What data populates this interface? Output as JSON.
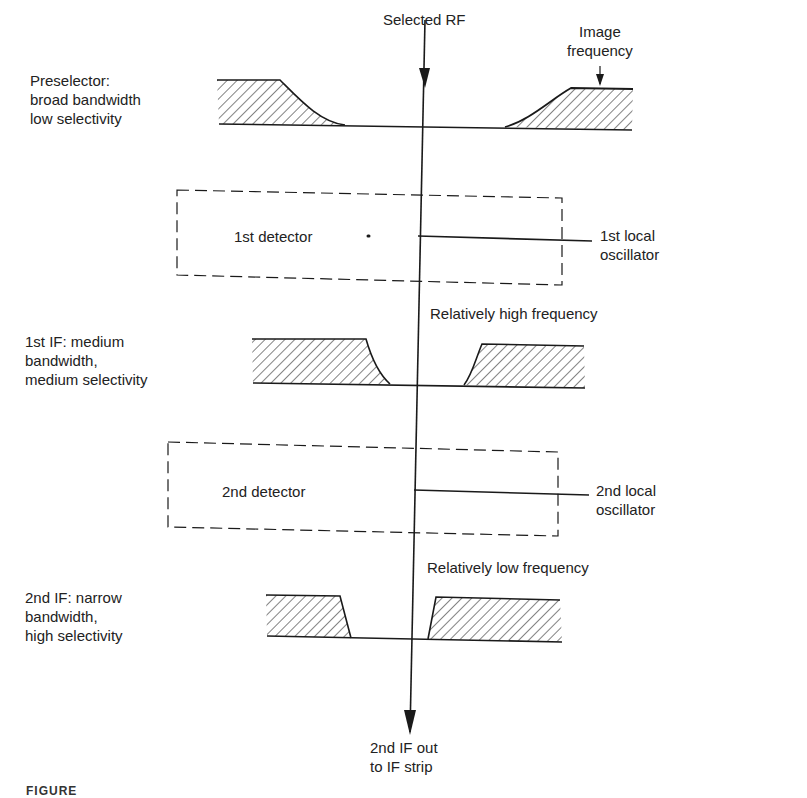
{
  "diagram": {
    "signal_path": {
      "input_label": "Selected RF",
      "output_label_lines": [
        "2nd IF out",
        "to IF strip"
      ]
    },
    "image_frequency_label_lines": [
      "Image",
      "frequency"
    ],
    "stages": [
      {
        "id": "preselector",
        "type": "filter",
        "label_lines": [
          "Preselector:",
          "broad bandwidth",
          "low selectivity"
        ],
        "bandwidth": "broad",
        "selectivity": "low"
      },
      {
        "id": "detector-1",
        "type": "mixer",
        "label": "1st detector",
        "oscillator_label_lines": [
          "1st local",
          "oscillator"
        ]
      },
      {
        "id": "if-1",
        "type": "filter",
        "output_note": "Relatively high frequency",
        "label_lines": [
          "1st IF:  medium",
          "bandwidth,",
          "medium selectivity"
        ],
        "bandwidth": "medium",
        "selectivity": "medium"
      },
      {
        "id": "detector-2",
        "type": "mixer",
        "label": "2nd detector",
        "oscillator_label_lines": [
          "2nd local",
          "oscillator"
        ]
      },
      {
        "id": "if-2",
        "type": "filter",
        "output_note": "Relatively low frequency",
        "label_lines": [
          "2nd IF:  narrow",
          "bandwidth,",
          "high selectivity"
        ],
        "bandwidth": "narrow",
        "selectivity": "high"
      }
    ],
    "caption": "FIGURE"
  },
  "colors": {
    "ink": "#1a1a1a",
    "background": "#ffffff"
  }
}
